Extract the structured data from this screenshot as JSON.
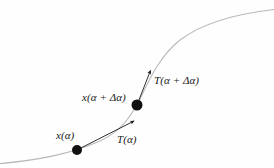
{
  "figure": {
    "kind": "math-diagram",
    "background_color": "#fefefe",
    "curve_color": "#b8b8b8",
    "vector_color": "#1a1a1a",
    "point_color": "#111111",
    "labels": {
      "point_alpha": "x(α)",
      "tangent_alpha": "T(α)",
      "point_alpha_delta": "x(α + Δα)",
      "tangent_alpha_delta": "T(α + Δα)"
    },
    "points": [
      {
        "name": "x(α)",
        "x": 77,
        "y": 150,
        "radius": 5
      },
      {
        "name": "x(α + Δα)",
        "x": 137,
        "y": 105,
        "radius": 5.5
      }
    ],
    "vectors": [
      {
        "name": "T(α)",
        "from_x": 77,
        "from_y": 150,
        "to_x": 134,
        "to_y": 121
      },
      {
        "name": "T(α + Δα)",
        "from_x": 137,
        "from_y": 105,
        "to_x": 150,
        "to_y": 70
      }
    ],
    "curve_path": "M -4 164 C 40 160, 70 154, 100 141 C 120 132, 130 118, 140 99 C 150 78, 160 56, 180 40 C 205 21, 240 13, 278 9"
  }
}
